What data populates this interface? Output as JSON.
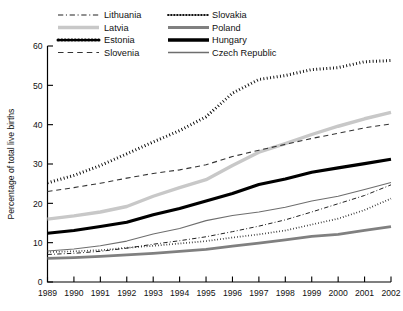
{
  "chart_data": {
    "type": "line",
    "title": "",
    "xlabel": "",
    "ylabel": "Percentage of total live births",
    "xlim": [
      1989,
      2002
    ],
    "ylim": [
      0,
      60
    ],
    "yticks": [
      0,
      10,
      20,
      30,
      40,
      50,
      60
    ],
    "grid": false,
    "legend_position": "top",
    "x": [
      1989,
      1990,
      1991,
      1992,
      1993,
      1994,
      1995,
      1996,
      1997,
      1998,
      1999,
      2000,
      2001,
      2002
    ],
    "categories": [
      "1989",
      "1990",
      "1991",
      "1992",
      "1993",
      "1994",
      "1995",
      "1996",
      "1997",
      "1998",
      "1999",
      "2000",
      "2001",
      "2002"
    ],
    "series": [
      {
        "name": "Lithuania",
        "style": "dash-dot",
        "color": "#222222",
        "width": 1.0,
        "values": [
          7.0,
          7.3,
          7.8,
          8.6,
          9.6,
          10.5,
          11.5,
          12.8,
          14.2,
          15.8,
          17.8,
          19.9,
          22.0,
          24.7
        ]
      },
      {
        "name": "Latvia",
        "style": "solid",
        "color": "#c8c8c8",
        "width": 3.4,
        "values": [
          16.0,
          16.8,
          17.8,
          19.2,
          21.8,
          24.0,
          26.0,
          29.6,
          33.0,
          35.2,
          37.5,
          39.6,
          41.5,
          43.1
        ]
      },
      {
        "name": "Estonia",
        "style": "dotted",
        "color": "#000000",
        "width": 3.0,
        "values": [
          25.2,
          27.1,
          29.6,
          32.6,
          35.6,
          38.5,
          42.0,
          48.0,
          51.5,
          52.5,
          54.0,
          54.5,
          56.0,
          56.3
        ]
      },
      {
        "name": "Slovenia",
        "style": "dashed",
        "color": "#333333",
        "width": 1.1,
        "values": [
          23.0,
          24.0,
          25.1,
          26.4,
          27.6,
          28.5,
          29.8,
          31.9,
          33.5,
          35.0,
          36.5,
          37.8,
          39.2,
          40.2
        ]
      },
      {
        "name": "Slovakia",
        "style": "fine-dotted",
        "color": "#111111",
        "width": 1.7,
        "values": [
          7.6,
          7.8,
          8.1,
          8.7,
          9.2,
          9.8,
          10.4,
          11.3,
          12.1,
          13.1,
          14.6,
          16.1,
          18.3,
          21.2
        ]
      },
      {
        "name": "Poland",
        "style": "solid",
        "color": "#808080",
        "width": 2.8,
        "values": [
          6.0,
          6.2,
          6.5,
          6.9,
          7.3,
          7.8,
          8.3,
          9.1,
          9.9,
          10.7,
          11.6,
          12.1,
          13.1,
          14.1
        ]
      },
      {
        "name": "Hungary",
        "style": "solid",
        "color": "#000000",
        "width": 3.2,
        "values": [
          12.4,
          13.1,
          14.1,
          15.2,
          17.1,
          18.7,
          20.6,
          22.5,
          24.8,
          26.2,
          27.9,
          29.0,
          30.1,
          31.2
        ]
      },
      {
        "name": "Czech Republic",
        "style": "solid",
        "color": "#6e6e6e",
        "width": 1.1,
        "values": [
          7.9,
          8.4,
          9.2,
          10.4,
          12.2,
          13.6,
          15.6,
          16.9,
          17.8,
          19.0,
          20.6,
          21.8,
          23.5,
          25.3
        ]
      }
    ],
    "legend": [
      {
        "label": "Lithuania",
        "style": "dash-dot",
        "color": "#222222",
        "width": 1.2
      },
      {
        "label": "Slovakia",
        "style": "fine-dotted",
        "color": "#111111",
        "width": 1.8
      },
      {
        "label": "Latvia",
        "style": "solid",
        "color": "#c8c8c8",
        "width": 3.4
      },
      {
        "label": "Poland",
        "style": "solid",
        "color": "#808080",
        "width": 2.8
      },
      {
        "label": "Estonia",
        "style": "dotted",
        "color": "#000000",
        "width": 3.0
      },
      {
        "label": "Hungary",
        "style": "solid",
        "color": "#000000",
        "width": 3.4
      },
      {
        "label": "Slovenia",
        "style": "dashed",
        "color": "#333333",
        "width": 1.2
      },
      {
        "label": "Czech Republic",
        "style": "solid",
        "color": "#6e6e6e",
        "width": 1.3
      }
    ]
  }
}
